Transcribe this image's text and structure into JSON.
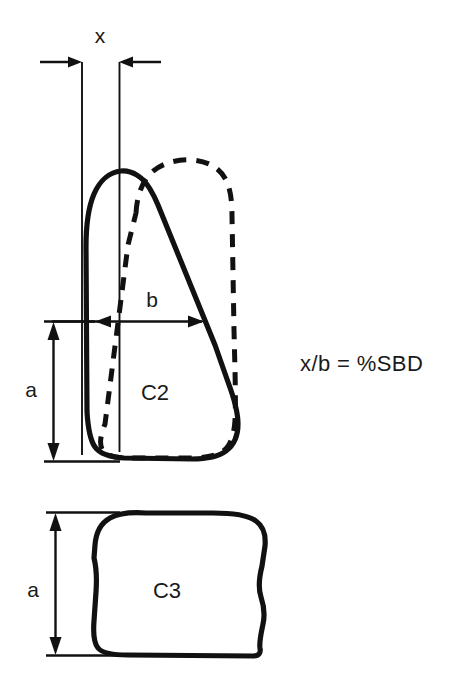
{
  "figure": {
    "background_color": "#ffffff",
    "ink_color": "#111111"
  },
  "labels": {
    "x": "x",
    "b": "b",
    "a_upper": "a",
    "a_lower": "a",
    "c2": "C2",
    "c3": "C3",
    "formula": "x/b  =  %SBD"
  },
  "annotations": {
    "x_dimension": {
      "label": "x",
      "description": "horizontal offset between posterior vertebral reference lines",
      "left_line_x": 82,
      "right_line_x": 119,
      "arrow_y": 62
    },
    "b_dimension": {
      "label": "b",
      "description": "anteroposterior width of C2 body",
      "start_x": 95,
      "end_x": 202,
      "arrow_y": 321
    },
    "a_dimension_upper": {
      "label": "a",
      "description": "height of C2 body",
      "line_x": 53,
      "top_y": 324,
      "bottom_y": 460
    },
    "a_dimension_lower": {
      "label": "a",
      "description": "height of C3 body",
      "line_x": 55,
      "top_y": 513,
      "bottom_y": 654
    }
  },
  "shapes": {
    "c2_solid": {
      "name": "C2 vertebral body outline",
      "style": "solid",
      "stroke_width": 5.2
    },
    "c2_dashed": {
      "name": "C2 displaced position outline",
      "style": "dashed",
      "stroke_width": 5.0,
      "dash_pattern": "13 10"
    },
    "c3_solid": {
      "name": "C3 vertebral body outline",
      "style": "solid",
      "stroke_width": 5.2
    }
  }
}
